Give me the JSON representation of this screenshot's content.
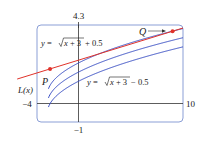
{
  "chart_data": {
    "type": "line",
    "title": "",
    "xlabel": "",
    "ylabel": "",
    "xlim": [
      -4,
      10
    ],
    "ylim": [
      -1,
      4.3
    ],
    "grid": false,
    "frame_labels": {
      "x_min": "−4",
      "x_max": "10",
      "y_max": "4.3",
      "y_min": "−1"
    },
    "series": [
      {
        "name": "y = √(x + 3) + 0.5",
        "color": "#3a4fc4",
        "offset": 0.5
      },
      {
        "name": "y = √(x + 3)",
        "color": "#3a4fc4",
        "offset": 0
      },
      {
        "name": "y = √(x + 3) − 0.5",
        "color": "#3a4fc4",
        "offset": -0.5
      },
      {
        "name": "L(x)",
        "color": "#e0322a",
        "type": "secant-line",
        "points": {
          "P": [
            -2.75,
            1.9
          ],
          "Q": [
            9.0,
            3.96
          ]
        }
      }
    ],
    "annotations": [
      {
        "text": "y = √x + 3 + 0.5",
        "target": "upper curve"
      },
      {
        "text": "y = √x + 3 − 0.5",
        "target": "lower curve"
      },
      {
        "text": "L(x)",
        "target": "red line"
      },
      {
        "text": "P",
        "target": "left endpoint of L"
      },
      {
        "text": "Q",
        "target": "right endpoint of L",
        "arrow": true
      }
    ]
  },
  "labels": {
    "upper_eq_prefix": "y = ",
    "upper_eq_rad": "x + 3",
    "upper_eq_suffix": " + 0.5",
    "lower_eq_prefix": "y = ",
    "lower_eq_rad": "x + 3",
    "lower_eq_suffix": " − 0.5",
    "L": "L(x)",
    "P": "P",
    "Q": "Q",
    "x_min": "−4",
    "x_max": "10",
    "y_max": "4.3",
    "y_min": "−1"
  },
  "colors": {
    "curve": "#3a4fc4",
    "line": "#e0322a",
    "frame": "#8b9fd6",
    "axis": "#333333"
  }
}
